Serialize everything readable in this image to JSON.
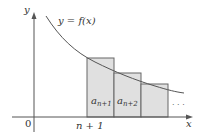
{
  "diagram": {
    "axes": {
      "x_label": "x",
      "y_label": "y",
      "origin_label": "0",
      "tick_label": "n + 1"
    },
    "curve": {
      "label": "y = f(x)"
    },
    "rectangles": [
      {
        "label_main": "a",
        "label_sub": "n+1"
      },
      {
        "label_main": "a",
        "label_sub": "n+2"
      },
      {
        "label_main": "",
        "label_sub": ""
      }
    ],
    "ellipsis": "· · ·",
    "colors": {
      "rect_fill": "#e0e0e0",
      "rect_stroke": "#666666",
      "curve": "#555555",
      "axis": "#555555",
      "text": "#333333"
    }
  }
}
